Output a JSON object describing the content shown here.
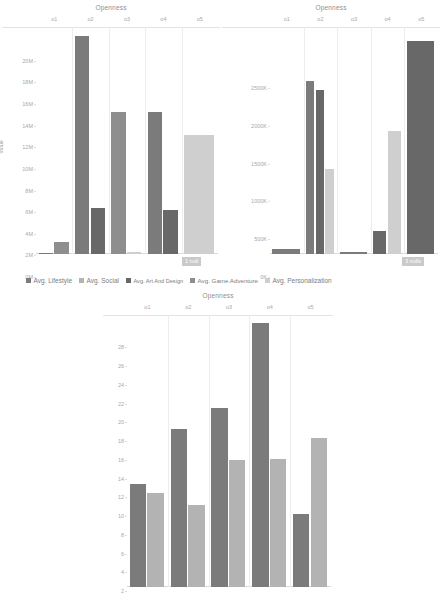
{
  "page": {
    "background": "#ffffff",
    "text_color": "#9a9a9a"
  },
  "palette": {
    "lifestyle": "#7b7b7b",
    "social": "#b3b3b3",
    "art_and_design": "#686868",
    "game_adventure": "#8e8e8e",
    "personalization": "#cfcfcf",
    "gridline": "#ededed",
    "axis": "#d8d8d8",
    "badge_bg": "#c9c9c9",
    "badge_text": "#ffffff"
  },
  "legend": {
    "name": "series-legend",
    "items": [
      {
        "label": "Avg. Lifestyle",
        "color": "#7b7b7b"
      },
      {
        "label": "Avg. Social",
        "color": "#b3b3b3"
      },
      {
        "label": "Avg. Art And Design",
        "color": "#686868"
      },
      {
        "label": "Avg. Game Adventure",
        "color": "#8e8e8e"
      },
      {
        "label": "Avg. Personalization",
        "color": "#cfcfcf"
      }
    ]
  },
  "badges": {
    "chart1": "1 null",
    "chart2": "3 nulls"
  },
  "chart_data": [
    {
      "id": "chart-installs-left",
      "type": "bar",
      "title": "Openness",
      "xlabel": "",
      "ylabel": "Value",
      "categories": [
        "o1",
        "o2",
        "o3",
        "o4",
        "o5"
      ],
      "ylim": [
        0,
        21000000
      ],
      "yticks": [
        0,
        2000000,
        4000000,
        6000000,
        8000000,
        10000000,
        12000000,
        14000000,
        16000000,
        18000000,
        20000000
      ],
      "ytick_labels": [
        "0M",
        "2M",
        "4M",
        "6M",
        "8M",
        "10M",
        "12M",
        "14M",
        "16M",
        "18M",
        "20M"
      ],
      "grid": true,
      "legend_position": "bottom",
      "series": [
        {
          "name": "Avg. Lifestyle",
          "color": "#7b7b7b",
          "values": [
            80000,
            20200000,
            0,
            13100000,
            0
          ]
        },
        {
          "name": "Avg. Social",
          "color": "#b3b3b3",
          "values": [
            0,
            0,
            0,
            0,
            0
          ]
        },
        {
          "name": "Avg. Art And Design",
          "color": "#686868",
          "values": [
            0,
            4300000,
            0,
            4100000,
            0
          ]
        },
        {
          "name": "Avg. Game Adventure",
          "color": "#8e8e8e",
          "values": [
            1100000,
            0,
            13100000,
            0,
            0
          ]
        },
        {
          "name": "Avg. Personalization",
          "color": "#cfcfcf",
          "values": [
            0,
            0,
            190000,
            0,
            11000000
          ]
        }
      ]
    },
    {
      "id": "chart-installs-right",
      "type": "bar",
      "title": "Openness",
      "xlabel": "",
      "ylabel": "",
      "categories": [
        "o1",
        "o2",
        "o3",
        "o4",
        "o5"
      ],
      "ylim": [
        0,
        3000000
      ],
      "yticks": [
        0,
        500000,
        1000000,
        1500000,
        2000000,
        2500000
      ],
      "ytick_labels": [
        "0K",
        "500K",
        "1000K",
        "1500K",
        "2000K",
        "2500K"
      ],
      "grid": true,
      "legend_position": "bottom",
      "series": [
        {
          "name": "Avg. Lifestyle",
          "color": "#7b7b7b",
          "values": [
            60000,
            2280000,
            30000,
            0,
            0
          ]
        },
        {
          "name": "Avg. Social",
          "color": "#b3b3b3",
          "values": [
            0,
            0,
            0,
            0,
            0
          ]
        },
        {
          "name": "Avg. Art And Design",
          "color": "#686868",
          "values": [
            0,
            2170000,
            0,
            300000,
            2820000
          ]
        },
        {
          "name": "Avg. Game Adventure",
          "color": "#8e8e8e",
          "values": [
            0,
            0,
            0,
            0,
            0
          ]
        },
        {
          "name": "Avg. Personalization",
          "color": "#cfcfcf",
          "values": [
            0,
            1130000,
            0,
            1620000,
            0
          ]
        }
      ]
    },
    {
      "id": "chart-rating-bottom",
      "type": "bar",
      "title": "Openness",
      "xlabel": "",
      "ylabel": "",
      "categories": [
        "o1",
        "o2",
        "o3",
        "o4",
        "o5"
      ],
      "ylim": [
        0,
        29
      ],
      "yticks": [
        0,
        2,
        4,
        6,
        8,
        10,
        12,
        14,
        16,
        18,
        20,
        22,
        24,
        26,
        28
      ],
      "ytick_labels": [
        "0",
        "2",
        "4",
        "6",
        "8",
        "10",
        "12",
        "14",
        "16",
        "18",
        "20",
        "22",
        "24",
        "26",
        "28"
      ],
      "grid": true,
      "legend_position": "none",
      "series": [
        {
          "name": "Avg. Lifestyle",
          "color": "#7b7b7b",
          "values": [
            11.0,
            16.9,
            19.1,
            28.2,
            7.8
          ]
        },
        {
          "name": "Avg. Social",
          "color": "#b3b3b3",
          "values": [
            10.0,
            8.7,
            13.5,
            13.6,
            15.9
          ]
        }
      ]
    }
  ]
}
